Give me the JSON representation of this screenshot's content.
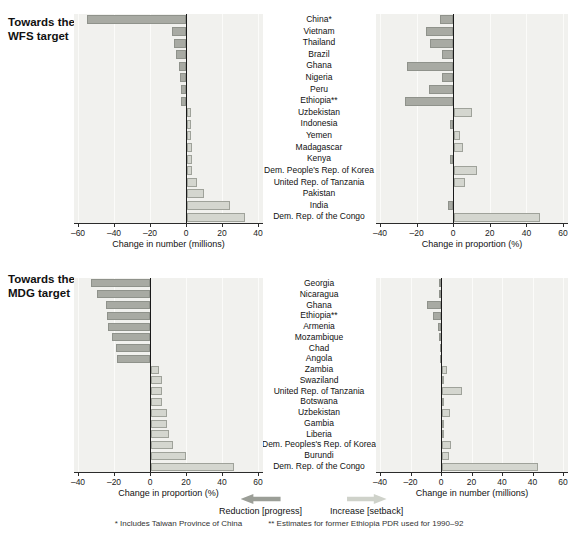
{
  "colors": {
    "reduction_fill": "#a8aaa3",
    "reduction_border": "#8f928b",
    "increase_fill": "#d4d6cf",
    "increase_border": "#9fa29a",
    "plot_background": "#f1f1ee",
    "gridline": "#fbfbf9",
    "zero_line": "#1a1a1a",
    "axis": "#2b2b2b"
  },
  "legend": {
    "reduction_label": "Reduction [progress]",
    "increase_label": "Increase [setback]",
    "reduction_arrow_icon": "left-block-arrow",
    "increase_arrow_icon": "right-block-arrow"
  },
  "footnotes": {
    "note1": "* Includes Taiwan Province of China",
    "note2": "** Estimates for former Ethiopia PDR used for 1990–92"
  },
  "chart_data": [
    {
      "id": "wfs",
      "type": "bar",
      "orientation": "horizontal",
      "title": "Towards the WFS target",
      "title_lines": [
        "Towards the",
        "WFS target"
      ],
      "categories": [
        "China*",
        "Vietnam",
        "Thailand",
        "Brazil",
        "Ghana",
        "Nigeria",
        "Peru",
        "Ethiopia**",
        "Uzbekistan",
        "Indonesia",
        "Yemen",
        "Madagascar",
        "Kenya",
        "Dem. People's Rep. of Korea",
        "United Rep. of Tanzania",
        "Pakistan",
        "India",
        "Dem. Rep. of the Congo"
      ],
      "panels": [
        {
          "side": "left",
          "xlabel": "Change in number (millions)",
          "xlim": [
            -60,
            40
          ],
          "tick_labels": [
            "–60",
            "–40",
            "–20",
            "0",
            "20",
            "40"
          ],
          "tick_values": [
            -60,
            -40,
            -20,
            0,
            20,
            40
          ],
          "zero_tick_index": 3,
          "units_per_tick": 20,
          "values": [
            -55,
            -8,
            -6.5,
            -5.5,
            -4,
            -3.5,
            -3,
            -3,
            2,
            2,
            2,
            2.5,
            2.5,
            3,
            5.5,
            9.5,
            24,
            32
          ]
        },
        {
          "side": "right",
          "xlabel": "Change in proportion (%)",
          "xlim": [
            -40,
            60
          ],
          "tick_labels": [
            "–40",
            "–20",
            "0",
            "20",
            "40",
            "60"
          ],
          "tick_values": [
            -40,
            -20,
            0,
            20,
            40,
            60
          ],
          "zero_tick_index": 2,
          "units_per_tick": 20,
          "values": [
            -7,
            -15,
            -12.5,
            -6,
            -25,
            -6,
            -13,
            -26.5,
            10,
            -2,
            3,
            5,
            -1.5,
            12.5,
            6,
            0,
            -3,
            47
          ]
        }
      ]
    },
    {
      "id": "mdg",
      "type": "bar",
      "orientation": "horizontal",
      "title": "Towards the MDG target",
      "title_lines": [
        "Towards the",
        "MDG target"
      ],
      "categories": [
        "Georgia",
        "Nicaragua",
        "Ghana",
        "Ethiopia**",
        "Armenia",
        "Mozambique",
        "Chad",
        "Angola",
        "Zambia",
        "Swaziland",
        "United Rep. of Tanzania",
        "Botswana",
        "Uzbekistan",
        "Gambia",
        "Liberia",
        "Dem. Peoples's Rep. of Korea",
        "Burundi",
        "Dem. Rep. of the Congo"
      ],
      "panels": [
        {
          "side": "left",
          "xlabel": "Change in proportion (%)",
          "xlim": [
            -40,
            60
          ],
          "tick_labels": [
            "–40",
            "–20",
            "0",
            "20",
            "40",
            "60"
          ],
          "tick_values": [
            -40,
            -20,
            0,
            20,
            40,
            60
          ],
          "zero_tick_index": 2,
          "units_per_tick": 20,
          "values": [
            -33,
            -29.5,
            -24.5,
            -24,
            -23.5,
            -21,
            -19,
            -18.5,
            4.5,
            6,
            6,
            6,
            9,
            9,
            10,
            12,
            19.5,
            46
          ]
        },
        {
          "side": "right",
          "xlabel": "Change in number (millions)",
          "xlim": [
            -40,
            60
          ],
          "tick_labels": [
            "–40",
            "–20",
            "0",
            "20",
            "40",
            "40",
            "60"
          ],
          "tick_values": [
            -40,
            -20,
            0,
            20,
            40,
            40,
            60
          ],
          "zero_tick_index": 2,
          "units_per_tick": 20,
          "values": [
            -1,
            -1.5,
            -9,
            -5,
            -2,
            -1,
            -0.5,
            -0.3,
            3,
            0.3,
            13,
            0.3,
            5.5,
            0.3,
            1.2,
            6,
            4.5,
            63
          ]
        }
      ]
    }
  ]
}
